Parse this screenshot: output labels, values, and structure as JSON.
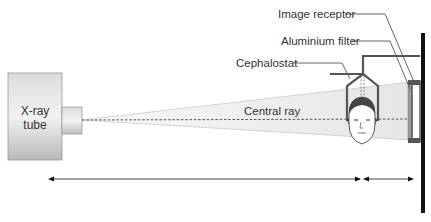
{
  "diagram": {
    "labels": {
      "xray_tube_line1": "X-ray",
      "xray_tube_line2": "tube",
      "central_ray": "Central ray",
      "cephalostat": "Cephalostat",
      "aluminium_filter": "Aluminium filter",
      "image_receptor": "Image receptor"
    },
    "components": [
      "x-ray-tube",
      "collimator",
      "x-ray-beam",
      "central-ray",
      "cephalostat",
      "patient-head",
      "aluminium-filter",
      "image-receptor",
      "wall-support",
      "source-to-midsagittal-distance-arrow",
      "midsagittal-to-receptor-distance-arrow"
    ],
    "colors": {
      "tube_gradient_top": "#d6d6d6",
      "tube_gradient_bottom": "#bdbdbd",
      "beam_fill": "#ececec",
      "frame": "#555555",
      "support": "#111111",
      "text": "#333333"
    }
  }
}
